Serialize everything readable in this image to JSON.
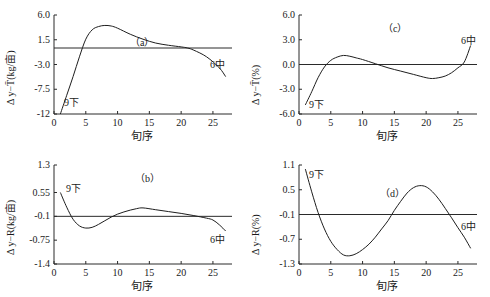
{
  "chart_data": [
    {
      "id": "a",
      "type": "line",
      "panel_label": "（a）",
      "xlabel": "旬序",
      "ylabel": "Δ y−T̄(kg/亩)",
      "x_ticks": [
        "0",
        "5",
        "10",
        "15",
        "20",
        "25"
      ],
      "y_ticks": [
        "6.0",
        "1.5",
        "-3.0",
        "-7.5",
        "-12"
      ],
      "xlim": [
        0,
        28
      ],
      "ylim": [
        -12,
        6
      ],
      "grid": false,
      "reference_line_y": 0,
      "start_label": "9下",
      "end_label": "6中",
      "series": [
        {
          "name": "Δy−T̄",
          "x": [
            1,
            2,
            3,
            4,
            5,
            6,
            7,
            8,
            9,
            10,
            12,
            14,
            16,
            18,
            20,
            21,
            22,
            24,
            26,
            27
          ],
          "y": [
            -12,
            -8.6,
            -5.2,
            -1.6,
            1.6,
            3.3,
            3.9,
            4.1,
            4.0,
            3.6,
            2.5,
            1.6,
            0.9,
            0.5,
            0.2,
            0.0,
            -0.4,
            -1.6,
            -3.6,
            -5.2
          ]
        }
      ]
    },
    {
      "id": "c",
      "type": "line",
      "panel_label": "（c）",
      "xlabel": "旬序",
      "ylabel": "Δ y−T̄(%)",
      "x_ticks": [
        "0",
        "5",
        "10",
        "15",
        "20",
        "25"
      ],
      "y_ticks": [
        "6.0",
        "3.0",
        "0.0",
        "-3.0",
        "-6.0"
      ],
      "xlim": [
        0,
        28
      ],
      "ylim": [
        -6,
        6
      ],
      "grid": false,
      "reference_line_y": 0,
      "start_label": "9下",
      "end_label": "6中",
      "series": [
        {
          "name": "Δy−T̄",
          "x": [
            1,
            2,
            3,
            4,
            5,
            6,
            7,
            8,
            9,
            10,
            12,
            14,
            16,
            18,
            20,
            21,
            22,
            23,
            24,
            25,
            26,
            27
          ],
          "y": [
            -4.9,
            -3.3,
            -1.6,
            -0.3,
            0.5,
            0.9,
            1.1,
            1.0,
            0.8,
            0.6,
            0.1,
            -0.4,
            -0.8,
            -1.2,
            -1.6,
            -1.7,
            -1.6,
            -1.4,
            -1.0,
            -0.4,
            0.3,
            2.3
          ]
        }
      ]
    },
    {
      "id": "b",
      "type": "line",
      "panel_label": "（b）",
      "xlabel": "旬序",
      "ylabel": "Δ y−R(kg/亩)",
      "x_ticks": [
        "0",
        "5",
        "10",
        "15",
        "20",
        "25"
      ],
      "y_ticks": [
        "1.3",
        "0.55",
        "-0.1",
        "-0.75",
        "-1.4"
      ],
      "xlim": [
        0,
        28
      ],
      "ylim": [
        -1.4,
        1.3
      ],
      "grid": false,
      "reference_line_y": -0.1,
      "start_label": "9下",
      "end_label": "6中",
      "series": [
        {
          "name": "Δy−R",
          "x": [
            1,
            2,
            3,
            4,
            5,
            6,
            7,
            8,
            9,
            10,
            11,
            12,
            13,
            14,
            16,
            18,
            20,
            22,
            24,
            25,
            26,
            27
          ],
          "y": [
            0.55,
            0.15,
            -0.18,
            -0.36,
            -0.42,
            -0.4,
            -0.32,
            -0.22,
            -0.12,
            -0.04,
            0.02,
            0.07,
            0.11,
            0.13,
            0.08,
            0.03,
            -0.02,
            -0.08,
            -0.15,
            -0.2,
            -0.33,
            -0.5
          ]
        }
      ]
    },
    {
      "id": "d",
      "type": "line",
      "panel_label": "（d）",
      "xlabel": "旬序",
      "ylabel": "Δ y−R(%)",
      "x_ticks": [
        "0",
        "5",
        "10",
        "15",
        "20",
        "25"
      ],
      "y_ticks": [
        "1.1",
        "0.5",
        "-0.1",
        "-0.7",
        "-1.3"
      ],
      "xlim": [
        0,
        28
      ],
      "ylim": [
        -1.3,
        1.1
      ],
      "grid": false,
      "reference_line_y": -0.1,
      "start_label": "9下",
      "end_label": "6中",
      "series": [
        {
          "name": "Δy−R",
          "x": [
            1,
            2,
            3,
            4,
            5,
            6,
            7,
            8,
            9,
            10,
            11,
            12,
            13,
            14,
            15,
            16,
            17,
            18,
            19,
            20,
            21,
            22,
            23,
            24,
            25,
            26,
            27
          ],
          "y": [
            1.0,
            0.45,
            -0.05,
            -0.45,
            -0.75,
            -0.95,
            -1.08,
            -1.1,
            -1.05,
            -0.95,
            -0.82,
            -0.65,
            -0.45,
            -0.25,
            0.0,
            0.22,
            0.42,
            0.55,
            0.6,
            0.57,
            0.45,
            0.27,
            0.05,
            -0.18,
            -0.42,
            -0.65,
            -0.92
          ]
        }
      ]
    }
  ]
}
